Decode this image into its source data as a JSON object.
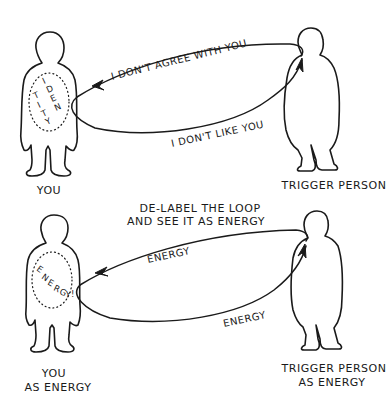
{
  "top_panel": {
    "left_figure": {
      "label": "YOU",
      "inner_label_letters": [
        "I",
        "D",
        "E",
        "N",
        "T",
        "I",
        "T",
        "Y"
      ],
      "inner_label": "IDENTITY"
    },
    "right_figure": {
      "label": "TRIGGER PERSON"
    },
    "loop_upper_text": "I DON'T AGREE WITH YOU",
    "loop_lower_text": "I DON'T LIKE YOU"
  },
  "caption": {
    "line1": "DE-LABEL THE LOOP",
    "line2": "AND SEE IT AS ENERGY"
  },
  "bottom_panel": {
    "left_figure": {
      "label_line1": "YOU",
      "label_line2": "AS ENERGY",
      "inner_label_letters": [
        "E",
        "N",
        "E",
        "R",
        "G",
        "Y",
        "!"
      ],
      "inner_label": "ENERGY!"
    },
    "right_figure": {
      "label_line1": "TRIGGER PERSON",
      "label_line2": "AS ENERGY"
    },
    "loop_upper_text": "ENERGY",
    "loop_lower_text": "ENERGY"
  },
  "colors": {
    "ink": "#1a1a1a",
    "background": "#ffffff"
  }
}
